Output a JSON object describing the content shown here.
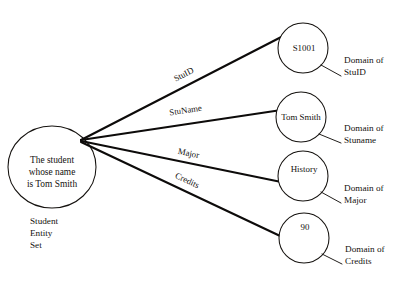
{
  "diagram": {
    "type": "er-attribute-domain-mapping",
    "entity": {
      "label_lines": [
        "The student",
        "whose name",
        "is Tom Smith"
      ],
      "caption_lines": [
        "Student",
        "Entity",
        "Set"
      ],
      "shape": "ellipse"
    },
    "attributes": [
      {
        "edge_label": "StuID",
        "value": "S1001",
        "domain_label_lines": [
          "Domain of",
          "StuID"
        ],
        "shape": "circle"
      },
      {
        "edge_label": "StuName",
        "value": "Tom  Smith",
        "domain_label_lines": [
          "Domain of",
          "Stuname"
        ],
        "shape": "circle"
      },
      {
        "edge_label": "Major",
        "value": "History",
        "domain_label_lines": [
          "Domain of",
          "Major"
        ],
        "shape": "circle"
      },
      {
        "edge_label": "Credits",
        "value": "90",
        "domain_label_lines": [
          "Domain of",
          "Credits"
        ],
        "shape": "circle"
      }
    ],
    "colors": {
      "background": "#ffffff",
      "stroke": "#15120f",
      "arrow": "#0d0b0a",
      "text": "#15120f"
    }
  }
}
